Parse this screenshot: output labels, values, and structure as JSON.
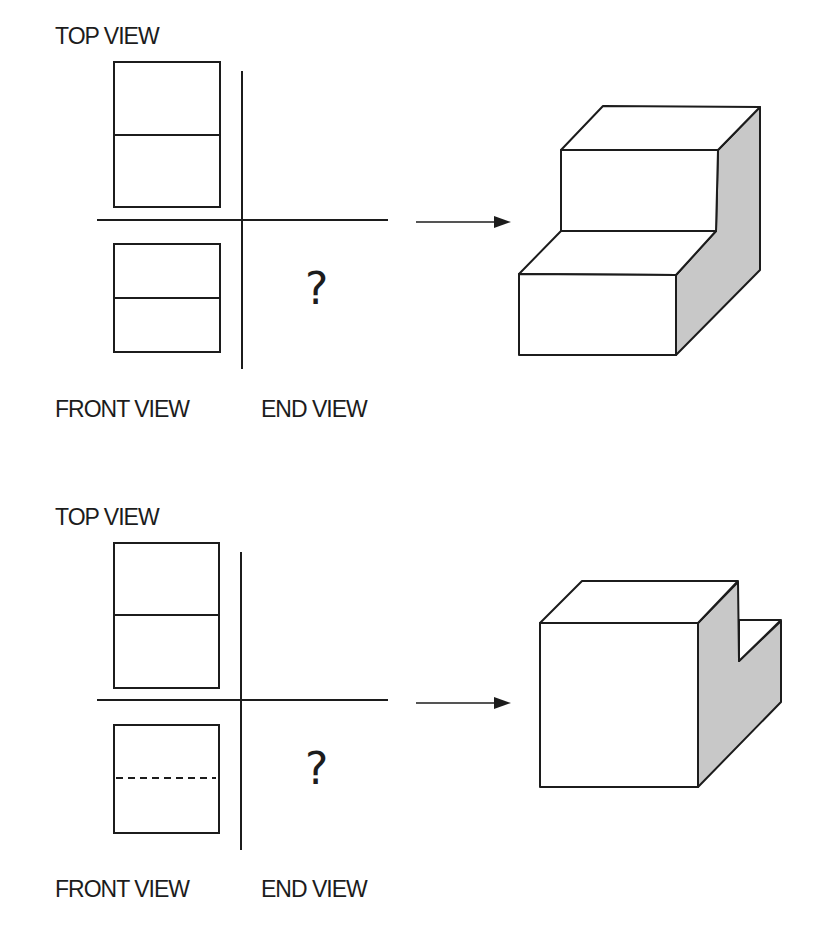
{
  "diagram": {
    "colors": {
      "line": "#1c1c1c",
      "shade": "#c8c8c8",
      "background": "#ffffff"
    },
    "problems": [
      {
        "id": 1,
        "labels": {
          "top_view": "TOP VIEW",
          "front_view": "FRONT VIEW",
          "end_view": "END VIEW"
        },
        "end_view_answer": "?",
        "top_view": {
          "divider": "solid"
        },
        "front_view": {
          "divider": "solid"
        },
        "object": "stepped block (two-step stair)"
      },
      {
        "id": 2,
        "labels": {
          "top_view": "TOP VIEW",
          "front_view": "FRONT VIEW",
          "end_view": "END VIEW"
        },
        "end_view_answer": "?",
        "top_view": {
          "divider": "solid"
        },
        "front_view": {
          "divider": "hidden (dashed)"
        },
        "object": "block with rear step notch"
      }
    ]
  }
}
